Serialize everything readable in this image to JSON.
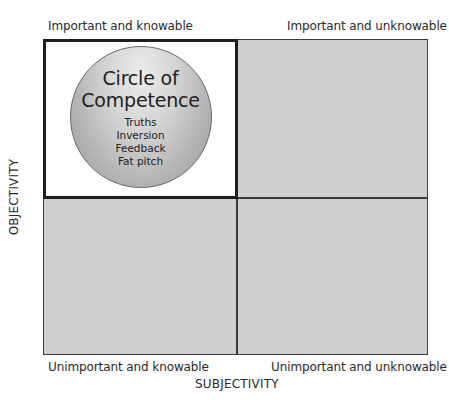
{
  "quadrants": {
    "top_left": "Important and knowable",
    "top_right": "Important and unknowable",
    "bottom_left": "Unimportant and knowable",
    "bottom_right": "Unimportant and unknowable"
  },
  "axes": {
    "x_label": "SUBJECTIVITY",
    "y_label": "OBJECTIVITY"
  },
  "circle": {
    "title_line1": "Circle of",
    "title_line2": "Competence",
    "items": [
      "Truths",
      "Inversion",
      "Feedback",
      "Fat pitch"
    ]
  },
  "colors": {
    "quadrant_fill": "#cfcfcf",
    "highlight_fill": "#ffffff",
    "border": "#1e1e1e"
  }
}
